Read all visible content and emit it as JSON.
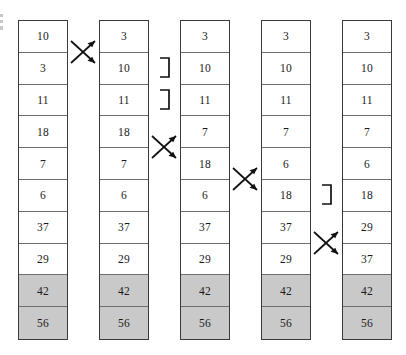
{
  "figure": {
    "type": "sorting-trace",
    "column_count": 5,
    "row_count": 10,
    "shaded_color": "#c9c9c9",
    "border_color": "#3a3a3a",
    "shaded_meaning": "already-sorted tail elements"
  },
  "columns": [
    {
      "index": 0,
      "name": "array-state-1",
      "values": [
        "10",
        "3",
        "11",
        "18",
        "7",
        "6",
        "37",
        "29",
        "42",
        "56"
      ],
      "shaded_rows": [
        8,
        9
      ]
    },
    {
      "index": 1,
      "name": "array-state-2",
      "values": [
        "3",
        "10",
        "11",
        "18",
        "7",
        "6",
        "37",
        "29",
        "42",
        "56"
      ],
      "shaded_rows": [
        8,
        9
      ]
    },
    {
      "index": 2,
      "name": "array-state-3",
      "values": [
        "3",
        "10",
        "11",
        "7",
        "18",
        "6",
        "37",
        "29",
        "42",
        "56"
      ],
      "shaded_rows": [
        8,
        9
      ]
    },
    {
      "index": 3,
      "name": "array-state-4",
      "values": [
        "3",
        "10",
        "11",
        "7",
        "6",
        "18",
        "37",
        "29",
        "42",
        "56"
      ],
      "shaded_rows": [
        8,
        9
      ]
    },
    {
      "index": 4,
      "name": "array-state-5",
      "values": [
        "3",
        "10",
        "11",
        "7",
        "6",
        "18",
        "29",
        "37",
        "42",
        "56"
      ],
      "shaded_rows": [
        8,
        9
      ]
    }
  ],
  "annotations": [
    {
      "id": "swap-1",
      "kind": "swap-arrows",
      "between_columns": [
        0,
        1
      ],
      "rows": [
        0,
        1
      ]
    },
    {
      "id": "bracket-1",
      "kind": "comparison-bracket",
      "between_columns": [
        1,
        2
      ],
      "row": 1
    },
    {
      "id": "bracket-2",
      "kind": "comparison-bracket",
      "between_columns": [
        1,
        2
      ],
      "row": 2
    },
    {
      "id": "swap-2",
      "kind": "swap-arrows",
      "between_columns": [
        1,
        2
      ],
      "rows": [
        3,
        4
      ]
    },
    {
      "id": "swap-3",
      "kind": "swap-arrows",
      "between_columns": [
        2,
        3
      ],
      "rows": [
        4,
        5
      ]
    },
    {
      "id": "bracket-3",
      "kind": "comparison-bracket",
      "between_columns": [
        3,
        4
      ],
      "row": 5
    },
    {
      "id": "swap-4",
      "kind": "swap-arrows",
      "between_columns": [
        3,
        4
      ],
      "rows": [
        6,
        7
      ]
    }
  ]
}
